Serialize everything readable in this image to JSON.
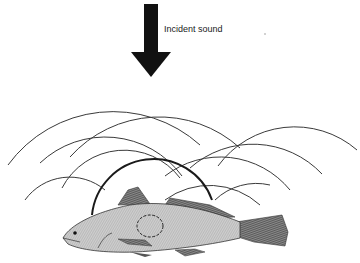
{
  "figure": {
    "labels": {
      "incident": "Incident sound"
    },
    "colors": {
      "ink": "#1a1a1a",
      "arc": "#3a3a3a",
      "fish_body": "#d9d9d9",
      "fin": "#6a6a6a",
      "background": "#ffffff"
    },
    "arrow": {
      "x": 152,
      "y_top": 4,
      "y_bottom": 78,
      "shaft_width": 14,
      "head_width": 40,
      "head_height": 26
    },
    "arcs": [
      {
        "cx": 110,
        "cy": 190,
        "r": 170,
        "comment": "large left arc"
      },
      {
        "cx": 160,
        "cy": 200,
        "r": 165
      },
      {
        "cx": 105,
        "cy": 175,
        "r": 105
      },
      {
        "cx": 260,
        "cy": 205,
        "r": 120
      },
      {
        "cx": 290,
        "cy": 175,
        "r": 95
      },
      {
        "cx": 230,
        "cy": 185,
        "r": 85
      },
      {
        "cx": 95,
        "cy": 215,
        "r": 70
      },
      {
        "cx": 120,
        "cy": 235,
        "r": 90
      },
      {
        "cx": 210,
        "cy": 240,
        "r": 80
      }
    ],
    "bladder_arc": {
      "cx": 150,
      "cy": 250,
      "r": 72,
      "stroke_width": 2
    },
    "swim_bladder": {
      "cx": 150,
      "cy": 225,
      "rx": 13,
      "ry": 11
    }
  }
}
